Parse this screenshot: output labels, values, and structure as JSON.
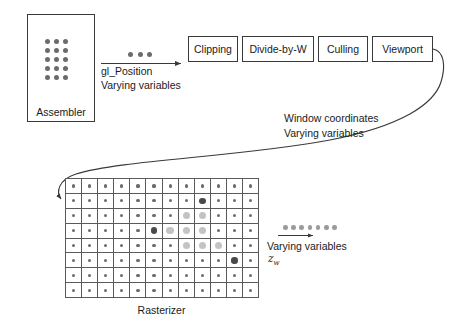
{
  "diagram": {
    "assembler": {
      "label": "Assembler",
      "dot_rows": 5,
      "dot_cols": 3,
      "dot_color": "#6b6b6b"
    },
    "pipeline_boxes": [
      {
        "label": "Clipping"
      },
      {
        "label": "Divide-by-W"
      },
      {
        "label": "Culling"
      },
      {
        "label": "Viewport"
      }
    ],
    "arrow_assembler_to_clipping": {
      "dot_count": 3,
      "dot_color": "#6b6b6b",
      "label_line1": "gl_Position",
      "label_line2": "Varying variables"
    },
    "curve_viewport_to_rasterizer": {
      "label_line1": "Window coordinates",
      "label_line2": "Varying variables"
    },
    "rasterizer": {
      "label": "Rasterizer",
      "columns": 12,
      "rows": 8,
      "sample_dot_color": "#6b6b6b",
      "covered_dot_color": "#c3c3c3",
      "vertex_dot_color": "#4a4a4a",
      "grid_line_color": "#5a5a5a",
      "triangle_vertices": [
        {
          "col": 8,
          "row": 1
        },
        {
          "col": 5,
          "row": 3
        },
        {
          "col": 10,
          "row": 5
        }
      ],
      "covered_samples": [
        {
          "col": 7,
          "row": 2
        },
        {
          "col": 8,
          "row": 2
        },
        {
          "col": 6,
          "row": 3
        },
        {
          "col": 7,
          "row": 3
        },
        {
          "col": 8,
          "row": 3
        },
        {
          "col": 7,
          "row": 4
        },
        {
          "col": 8,
          "row": 4
        },
        {
          "col": 9,
          "row": 4
        }
      ]
    },
    "rasterizer_output": {
      "dot_count": 7,
      "dot_color": "#9a9a9a",
      "label": "Varying variables",
      "symbol": "z",
      "symbol_subscript": "w"
    },
    "colors": {
      "stroke": "#3a3a3a",
      "text": "#1a1a1a",
      "background": "#ffffff"
    }
  }
}
